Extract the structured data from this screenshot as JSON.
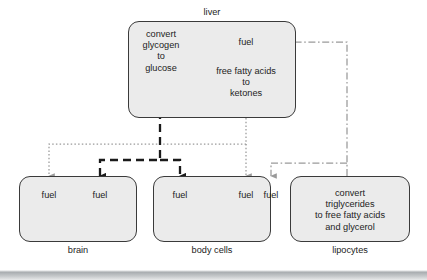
{
  "diagram": {
    "title_visible": false,
    "colors": {
      "box_fill": "#ebebeb",
      "box_stroke": "#3a3a3a",
      "text": "#232323",
      "dashed_black": "#1a1a1a",
      "dotted_gray": "#9a9a9a",
      "dashdot_gray": "#9a9a9a"
    },
    "nodes": [
      {
        "id": "liver",
        "label": "liver",
        "label_position": "top",
        "contents": [
          {
            "id": "liver-glycogen",
            "text": "convert\nglycogen\nto\nglucose"
          },
          {
            "id": "liver-fuel",
            "text": "fuel"
          },
          {
            "id": "liver-ketones",
            "text": "free fatty acids\nto\nketones"
          }
        ]
      },
      {
        "id": "brain",
        "label": "brain",
        "label_position": "bottom",
        "contents": [
          {
            "id": "brain-fuel-1",
            "text": "fuel"
          },
          {
            "id": "brain-fuel-2",
            "text": "fuel"
          }
        ]
      },
      {
        "id": "body-cells",
        "label": "body cells",
        "label_position": "bottom",
        "contents": [
          {
            "id": "body-fuel-1",
            "text": "fuel"
          },
          {
            "id": "body-fuel-2",
            "text": "fuel"
          },
          {
            "id": "body-fuel-3",
            "text": "fuel"
          }
        ]
      },
      {
        "id": "lipocytes",
        "label": "lipocytes",
        "label_position": "bottom",
        "contents": [
          {
            "id": "lipocytes-convert",
            "text": "convert\ntriglycerides\nto free fatty acids\nand glycerol"
          }
        ]
      }
    ],
    "connections": [
      {
        "id": "glucose-to-brain",
        "style": "dashed-black",
        "from": "liver-glycogen",
        "to": "brain-fuel-2"
      },
      {
        "id": "glucose-to-body",
        "style": "dashed-black",
        "from": "liver-glycogen",
        "to": "body-fuel-1"
      },
      {
        "id": "ketones-to-brain",
        "style": "dotted-gray",
        "from": "liver-ketones",
        "to": "brain-fuel-1"
      },
      {
        "id": "ketones-to-body",
        "style": "dotted-gray",
        "from": "liver-ketones",
        "to": "body-fuel-2"
      },
      {
        "id": "lipocytes-to-liver-fuel",
        "style": "dashdot-gray",
        "from": "lipocytes-convert",
        "to": "liver-fuel"
      },
      {
        "id": "lipocytes-to-body",
        "style": "dashdot-gray",
        "from": "lipocytes-convert",
        "to": "body-fuel-3"
      },
      {
        "id": "liverfuel-to-ketones",
        "style": "dotted-gray",
        "from": "liver-fuel",
        "to": "liver-ketones"
      }
    ]
  }
}
